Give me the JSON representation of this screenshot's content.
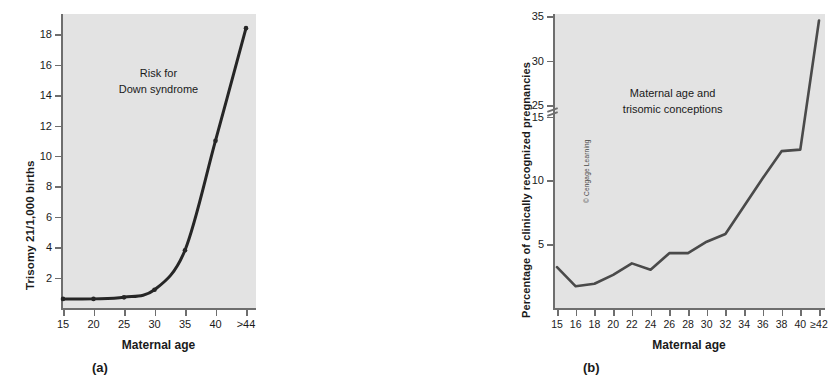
{
  "figure": {
    "credit": "© Cengage Learning"
  },
  "panel_a": {
    "letter": "(a)",
    "annotation_line1": "Risk for",
    "annotation_line2": "Down syndrome",
    "xlabel": "Maternal age",
    "ylabel": "Trisomy 21/1,000 births"
  },
  "panel_b": {
    "letter": "(b)",
    "annotation_line1": "Maternal age and",
    "annotation_line2": "trisomic conceptions",
    "xlabel": "Maternal age",
    "ylabel": "Percentage of clinically recognized pregnancies"
  },
  "chart_data": [
    {
      "type": "line",
      "id": "panel-a",
      "title": "Risk for Down syndrome",
      "xlabel": "Maternal age",
      "ylabel": "Trisomy 21/1,000 births",
      "categories": [
        "15",
        "20",
        "25",
        "30",
        "35",
        "40",
        ">44"
      ],
      "values": [
        0.6,
        0.6,
        0.7,
        1.2,
        3.8,
        11.0,
        18.4
      ],
      "ylim": [
        0,
        19.2
      ],
      "yticks": [
        2,
        4,
        6,
        8,
        10,
        12,
        14,
        16,
        18
      ],
      "ytick_labels": [
        "2",
        "4",
        "6",
        "8",
        "10",
        "12",
        "14",
        "16",
        "18"
      ],
      "grid": false,
      "legend": "none",
      "line_color": "#262626",
      "markers": true,
      "smooth": true
    },
    {
      "type": "line",
      "id": "panel-b",
      "title": "Maternal age and trisomic conceptions",
      "xlabel": "Maternal age",
      "ylabel": "Percentage of clinically recognized pregnancies",
      "categories": [
        "15",
        "16",
        "18",
        "20",
        "22",
        "24",
        "26",
        "28",
        "30",
        "32",
        "34",
        "36",
        "38",
        "40",
        "≥42"
      ],
      "values": [
        3.2,
        1.7,
        1.9,
        2.6,
        3.5,
        3.0,
        4.3,
        4.3,
        5.2,
        5.8,
        8.0,
        10.2,
        12.3,
        20.0,
        34.5
      ],
      "ylim": [
        0,
        35
      ],
      "yticks": [
        5,
        10,
        15,
        25,
        30,
        35
      ],
      "ytick_labels": [
        "5",
        "10",
        "15",
        "25",
        "30",
        "35"
      ],
      "axis_break": {
        "between": [
          15,
          25
        ],
        "present": true
      },
      "grid": false,
      "legend": "none",
      "line_color": "#4a4a4a",
      "markers": false,
      "smooth": false
    }
  ]
}
